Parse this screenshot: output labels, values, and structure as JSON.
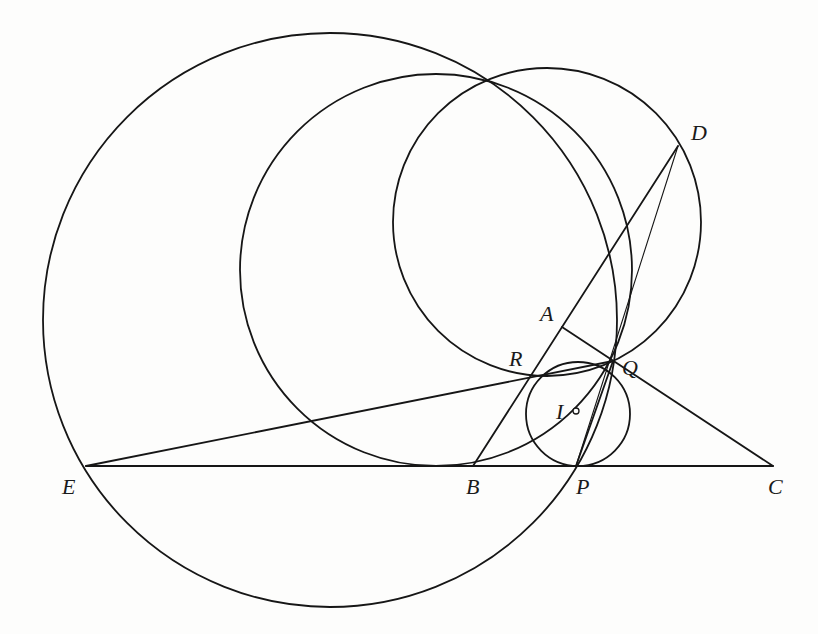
{
  "diagram": {
    "type": "geometry-construction",
    "colors": {
      "stroke": "#161616",
      "background": "#fdfdfc",
      "label": "#1a1a1a"
    },
    "points": [
      {
        "id": "A",
        "label": "A",
        "x": 562,
        "y": 327,
        "label_x": 540,
        "label_y": 321
      },
      {
        "id": "B",
        "label": "B",
        "x": 473,
        "y": 466,
        "label_x": 466,
        "label_y": 494
      },
      {
        "id": "C",
        "label": "C",
        "x": 773,
        "y": 466,
        "label_x": 768,
        "label_y": 494
      },
      {
        "id": "D",
        "label": "D",
        "x": 678,
        "y": 146,
        "label_x": 691,
        "label_y": 140
      },
      {
        "id": "E",
        "label": "E",
        "x": 86,
        "y": 466,
        "label_x": 62,
        "label_y": 494
      },
      {
        "id": "P",
        "label": "P",
        "x": 576,
        "y": 466,
        "label_x": 576,
        "label_y": 494
      },
      {
        "id": "Q",
        "label": "Q",
        "x": 613,
        "y": 361,
        "label_x": 622,
        "label_y": 375
      },
      {
        "id": "R",
        "label": "R",
        "x": 529,
        "y": 377,
        "label_x": 509,
        "label_y": 366
      },
      {
        "id": "I",
        "label": "I",
        "x": 576,
        "y": 411,
        "label_x": 556,
        "label_y": 419
      }
    ],
    "circles": [
      {
        "id": "big-circle",
        "cx": 330,
        "cy": 320,
        "r": 287,
        "passes_through": [
          "E",
          "Q",
          "P"
        ]
      },
      {
        "id": "middle-circle",
        "cx": 436,
        "cy": 270,
        "r": 196,
        "passes_through": [
          "I",
          "Q"
        ],
        "tangent_to": "BC"
      },
      {
        "id": "inner-circle",
        "cx": 547,
        "cy": 222,
        "r": 154,
        "passes_through": [
          "D",
          "R",
          "Q"
        ]
      },
      {
        "id": "incircle",
        "cx": 578,
        "cy": 414,
        "r": 52,
        "center": "I",
        "tangent_to": "BC at P"
      }
    ],
    "segments": [
      {
        "id": "line-E-C",
        "from": "E",
        "to": "C",
        "weight": "thick"
      },
      {
        "id": "line-E-Q",
        "from": "E",
        "to": "Q",
        "weight": "thick"
      },
      {
        "id": "line-B-D",
        "from": "B",
        "to": "D",
        "weight": "thick"
      },
      {
        "id": "line-A-C",
        "from": "A",
        "to": "C",
        "weight": "thick"
      },
      {
        "id": "line-Q-P",
        "from": "Q",
        "to": "P",
        "weight": "thick"
      },
      {
        "id": "line-D-P",
        "from": "D",
        "to": "P",
        "weight": "thin"
      }
    ],
    "marked_points": [
      "I"
    ]
  }
}
